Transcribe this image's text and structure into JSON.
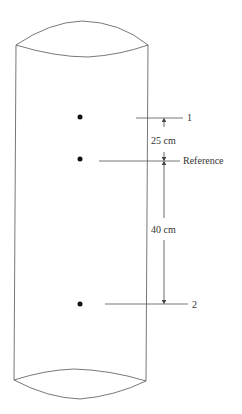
{
  "diagram": {
    "type": "cylinder-pressure-levels",
    "colors": {
      "stroke": "#444444",
      "text": "#333333",
      "background": "#ffffff"
    },
    "points": [
      {
        "id": "1",
        "label": "1"
      },
      {
        "id": "reference",
        "label": "Reference"
      },
      {
        "id": "2",
        "label": "2"
      }
    ],
    "dimensions": [
      {
        "from": "1",
        "to": "reference",
        "label": "25 cm"
      },
      {
        "from": "reference",
        "to": "2",
        "label": "40 cm"
      }
    ]
  }
}
